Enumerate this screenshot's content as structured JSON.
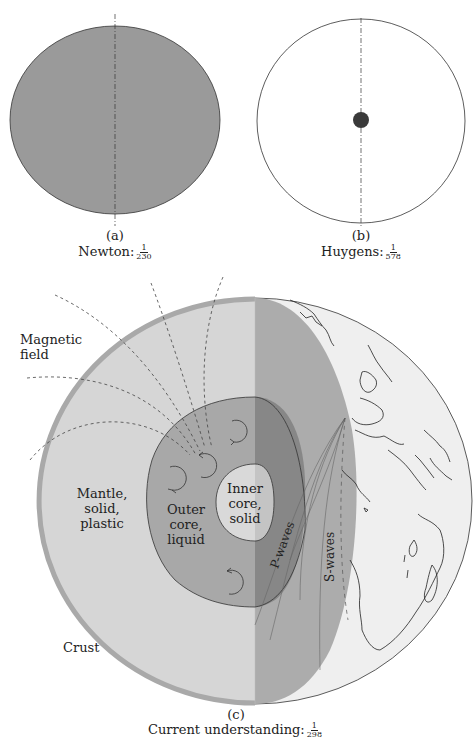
{
  "header": {
    "text": ""
  },
  "panels": [
    {
      "id": "a",
      "caption": "(a)",
      "label": "Newton:",
      "flattening": {
        "numerator": "1",
        "denominator": "230"
      }
    },
    {
      "id": "b",
      "caption": "(b)",
      "label": "Huygens:",
      "flattening": {
        "numerator": "1",
        "denominator": "578"
      }
    },
    {
      "id": "c",
      "caption": "(c)",
      "label": "Current understanding:",
      "flattening": {
        "numerator": "1",
        "denominator": "298"
      }
    }
  ],
  "earth_labels": {
    "magnetic_field": [
      "Magnetic",
      "field"
    ],
    "mantle": [
      "Mantle,",
      "solid,",
      "plastic"
    ],
    "outer_core": [
      "Outer",
      "core,",
      "liquid"
    ],
    "inner_core": [
      "Inner",
      "core,",
      "solid"
    ],
    "p_waves": "P-waves",
    "s_waves": "S-waves",
    "crust": "Crust"
  },
  "colors": {
    "newton_fill": "#9a9a9a",
    "huygens_dot": "#3a3a3a",
    "crust": "#a9a9a9",
    "mantle_light": "#d6d6d6",
    "mantle_dark": "#acacac",
    "outer_core_light": "#a8a8a8",
    "outer_core_dark": "#878787",
    "inner_core_light": "#d9d9d9",
    "inner_core_dark": "#c4c4c4",
    "surface": "#efefef"
  }
}
